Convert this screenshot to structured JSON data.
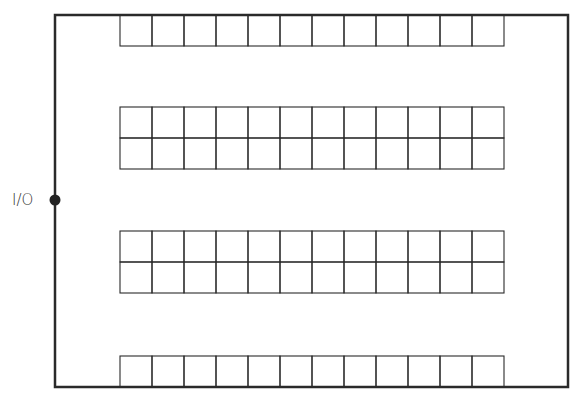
{
  "diagram": {
    "io_point": {
      "label": "I/O",
      "x": 55,
      "y": 200
    },
    "outer_boundary": {
      "left": 55,
      "top": 15,
      "right": 568,
      "bottom": 387,
      "stroke": "#2a2a2a",
      "stroke_width": 2.5
    },
    "rack_x_start": 120,
    "columns": 12,
    "cell_width": 32,
    "cell_height": 31,
    "rack_stroke": "#2a2a2a",
    "rack_blocks": [
      {
        "name": "top-single-row",
        "y": 15,
        "rows": 1
      },
      {
        "name": "upper-double-row",
        "y": 107,
        "rows": 2
      },
      {
        "name": "lower-double-row",
        "y": 231,
        "rows": 2
      },
      {
        "name": "bottom-single-row",
        "y": 356,
        "rows": 1
      }
    ]
  }
}
